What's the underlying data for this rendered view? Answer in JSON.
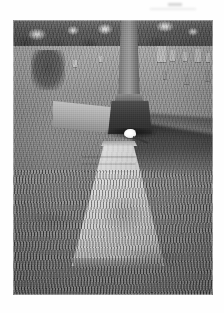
{
  "page": {
    "background_color": "#ffffff",
    "artifact_label": "scan-artifact"
  },
  "photograph": {
    "caption": "",
    "alt_description": "Black-and-white photograph of a cemetery plot: a tall tapering column monument on a dark plinth stands behind a flat light-colored ledger grave slab set into mown grass, with a white flower at the base of the monument, a long shadow falling to the right, distant headstones and a dark tree line along the horizon.",
    "medium": "halftone print",
    "color_mode": "grayscale",
    "frame": {
      "x": 13,
      "y": 20,
      "width": 200,
      "height": 275
    },
    "palette": {
      "sky": "#f4f4f4",
      "treeline": "#4d4d4d",
      "grass_far": "#a8a8a8",
      "grass_mid": "#8a8a8a",
      "grass_near": "#666666",
      "monument": "#8c8c8c",
      "plinth": "#3d3d3d",
      "slab": "#d2d0c8",
      "shadow": "#1e1e1e",
      "flower": "#ffffff"
    },
    "subjects": [
      {
        "name": "column-monument",
        "label": "Column monument"
      },
      {
        "name": "monument-plinth",
        "label": "Monument plinth"
      },
      {
        "name": "ledger-slab",
        "label": "Flat ledger grave slab"
      },
      {
        "name": "slab-inscription",
        "label": "Weathered inscription"
      },
      {
        "name": "white-flower",
        "label": "White flower at base"
      },
      {
        "name": "stone-kerb",
        "label": "Low stone kerb"
      },
      {
        "name": "cast-shadow",
        "label": "Cast shadow on grass"
      },
      {
        "name": "tree-line",
        "label": "Background tree line"
      },
      {
        "name": "background-graves",
        "label": "Distant headstones"
      }
    ],
    "background_headstones": [
      {
        "x": 144,
        "y": 26,
        "w": 9,
        "h": 16,
        "tone": "light"
      },
      {
        "x": 157,
        "y": 30,
        "w": 5,
        "h": 11,
        "tone": "light"
      },
      {
        "x": 170,
        "y": 32,
        "w": 4,
        "h": 9,
        "tone": "light"
      },
      {
        "x": 182,
        "y": 29,
        "w": 6,
        "h": 13,
        "tone": "light"
      },
      {
        "x": 193,
        "y": 33,
        "w": 4,
        "h": 9,
        "tone": "light"
      },
      {
        "x": 150,
        "y": 51,
        "w": 4,
        "h": 8,
        "tone": "dark"
      },
      {
        "x": 171,
        "y": 54,
        "w": 5,
        "h": 10,
        "tone": "dark"
      },
      {
        "x": 192,
        "y": 50,
        "w": 5,
        "h": 11,
        "tone": "dark"
      },
      {
        "x": 60,
        "y": 40,
        "w": 4,
        "h": 7,
        "tone": "light"
      },
      {
        "x": 86,
        "y": 36,
        "w": 3,
        "h": 6,
        "tone": "light"
      }
    ]
  }
}
